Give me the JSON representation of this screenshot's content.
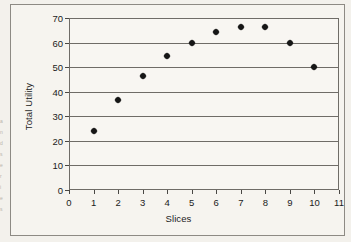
{
  "figure": {
    "background_color": "#f3f1ec",
    "frame_color": "#8d8a84",
    "plot_background": "#f8f6f2",
    "marker_color": "#161616",
    "gridline_color": "#6f6c67"
  },
  "margin_artifacts": [
    "a",
    "n",
    "d",
    "s",
    "e",
    "r",
    "i",
    "e",
    "s"
  ],
  "chart_data": {
    "type": "scatter",
    "title": "",
    "subtitle": "",
    "xlabel": "Slices",
    "ylabel": "Total Utility",
    "xlim": [
      0,
      11
    ],
    "ylim": [
      0,
      70
    ],
    "xticks": [
      0,
      1,
      2,
      3,
      4,
      5,
      6,
      7,
      8,
      9,
      10,
      11
    ],
    "xtick_labels": [
      "0",
      "1",
      "2",
      "3",
      "4",
      "5",
      "6",
      "7",
      "8",
      "9",
      "10",
      "11"
    ],
    "yticks": [
      0,
      10,
      20,
      30,
      40,
      50,
      60,
      70
    ],
    "ytick_labels": [
      "0",
      "10",
      "20",
      "30",
      "40",
      "50",
      "60",
      "70"
    ],
    "grid": {
      "horizontal": true,
      "vertical": false
    },
    "legend": {
      "visible": false,
      "position": "none"
    },
    "marker": "diamond",
    "x": [
      1,
      2,
      3,
      4,
      5,
      6,
      7,
      8,
      9,
      10
    ],
    "y": [
      24,
      36.5,
      46.5,
      54.5,
      60,
      64.5,
      66.5,
      66.5,
      60,
      50
    ],
    "points": [
      {
        "x": 1,
        "y": 24
      },
      {
        "x": 2,
        "y": 36.5
      },
      {
        "x": 3,
        "y": 46.5
      },
      {
        "x": 4,
        "y": 54.5
      },
      {
        "x": 5,
        "y": 60
      },
      {
        "x": 6,
        "y": 64.5
      },
      {
        "x": 7,
        "y": 66.5
      },
      {
        "x": 8,
        "y": 66.5
      },
      {
        "x": 9,
        "y": 60
      },
      {
        "x": 10,
        "y": 50
      }
    ]
  }
}
